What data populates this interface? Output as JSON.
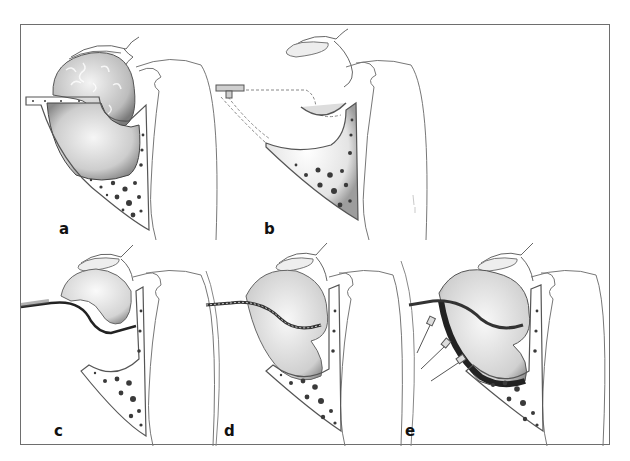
{
  "figure": {
    "panels": [
      {
        "id": "a",
        "label": "a"
      },
      {
        "id": "b",
        "label": "b"
      },
      {
        "id": "c",
        "label": "c"
      },
      {
        "id": "d",
        "label": "d"
      },
      {
        "id": "e",
        "label": "e"
      }
    ]
  },
  "colors": {
    "frame": "#6e6e6e",
    "line": "#555555",
    "bone_dots": "#3a3a3a",
    "tissue_fill": "#e6e6e6",
    "cavity_fill": "#cfcfcf",
    "dark_layer": "#2b2b2b"
  }
}
